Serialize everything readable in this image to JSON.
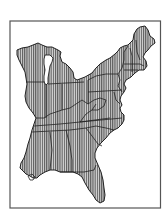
{
  "figure": {
    "type": "map",
    "style": "vertical-line hatched fill with state boundaries",
    "colors": {
      "background": "#ffffff",
      "frame": "#555555",
      "outline": "#222222",
      "hatch_line": "#3a3a3a",
      "hatch_bg": "#d8d8d8"
    },
    "regions": [
      "Wisconsin",
      "Michigan",
      "Illinois",
      "Indiana",
      "Ohio",
      "Kentucky",
      "Tennessee",
      "Mississippi",
      "Alabama",
      "Georgia",
      "Florida",
      "South Carolina",
      "North Carolina",
      "Virginia",
      "West Virginia",
      "Maryland",
      "Delaware",
      "Pennsylvania",
      "New Jersey",
      "New York",
      "Connecticut",
      "Rhode Island",
      "Massachusetts",
      "Vermont",
      "New Hampshire",
      "Maine"
    ],
    "shaded_regions": "all"
  }
}
